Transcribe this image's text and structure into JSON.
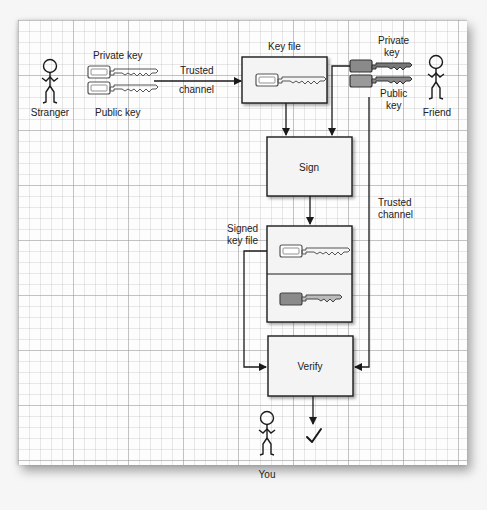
{
  "diagram": {
    "actors": {
      "stranger": "Stranger",
      "friend": "Friend",
      "you": "You"
    },
    "stranger_keys": {
      "private_label": "Private key",
      "public_label": "Public key"
    },
    "trusted_channel_top": {
      "line1": "Trusted",
      "line2": "channel"
    },
    "key_file": {
      "label": "Key file"
    },
    "friend_keys": {
      "private_line1": "Private",
      "private_line2": "key",
      "public_line1": "Public",
      "public_line2": "key"
    },
    "sign": {
      "label": "Sign"
    },
    "signed_key_file": {
      "line1": "Signed",
      "line2": "key file"
    },
    "trusted_channel_right": {
      "line1": "Trusted",
      "line2": "channel"
    },
    "verify": {
      "label": "Verify"
    },
    "result_icon": "checkmark-icon",
    "colors": {
      "line": "#1a1a1a",
      "box_fill": "#f4f4f4",
      "key_outline": "#555555",
      "private_key_fill_friend": "#8a8a8a",
      "public_key_fill_friend": "#9a9a9a",
      "grid_major": "#9a9a9a",
      "grid_minor": "#c8c8c8"
    }
  }
}
